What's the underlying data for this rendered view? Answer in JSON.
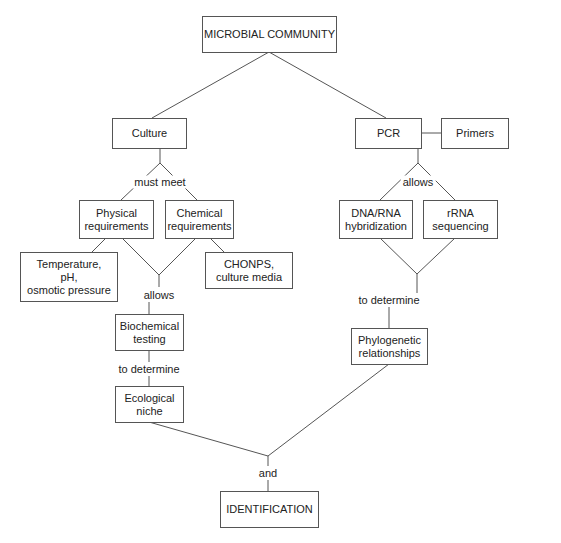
{
  "diagram": {
    "nodes": {
      "microbial_community": "MICROBIAL COMMUNITY",
      "culture": "Culture",
      "pcr": "PCR",
      "primers": "Primers",
      "physical": "Physical\nrequirements",
      "chemical": "Chemical\nrequirements",
      "temperature": "Temperature,\npH,\nosmotic pressure",
      "chonps": "CHONPS,\nculture media",
      "biochemical": "Biochemical\ntesting",
      "ecological": "Ecological\nniche",
      "dna_rna": "DNA/RNA\nhybridization",
      "rrna": "rRNA\nsequencing",
      "phylogenetic": "Phylogenetic\nrelationships",
      "identification": "IDENTIFICATION"
    },
    "links": {
      "must_meet": "must meet",
      "allows_left": "allows",
      "to_determine_left": "to determine",
      "allows_right": "allows",
      "to_determine_right": "to determine",
      "and": "and"
    },
    "edges": [
      {
        "from": "MICROBIAL COMMUNITY",
        "to": "Culture"
      },
      {
        "from": "MICROBIAL COMMUNITY",
        "to": "PCR"
      },
      {
        "from": "PCR",
        "to": "Primers"
      },
      {
        "from": "Culture",
        "to": "Physical requirements",
        "label": "must meet"
      },
      {
        "from": "Culture",
        "to": "Chemical requirements",
        "label": "must meet"
      },
      {
        "from": "Physical requirements",
        "to": "Temperature, pH, osmotic pressure"
      },
      {
        "from": "Chemical requirements",
        "to": "CHONPS, culture media"
      },
      {
        "from": "Physical requirements",
        "to": "Biochemical testing",
        "label": "allows"
      },
      {
        "from": "Chemical requirements",
        "to": "Biochemical testing",
        "label": "allows"
      },
      {
        "from": "Biochemical testing",
        "to": "Ecological niche",
        "label": "to determine"
      },
      {
        "from": "PCR",
        "to": "DNA/RNA hybridization",
        "label": "allows"
      },
      {
        "from": "PCR",
        "to": "rRNA sequencing",
        "label": "allows"
      },
      {
        "from": "DNA/RNA hybridization",
        "to": "Phylogenetic relationships",
        "label": "to determine"
      },
      {
        "from": "rRNA sequencing",
        "to": "Phylogenetic relationships",
        "label": "to determine"
      },
      {
        "from": "Ecological niche",
        "to": "IDENTIFICATION",
        "label": "and"
      },
      {
        "from": "Phylogenetic relationships",
        "to": "IDENTIFICATION",
        "label": "and"
      }
    ]
  }
}
